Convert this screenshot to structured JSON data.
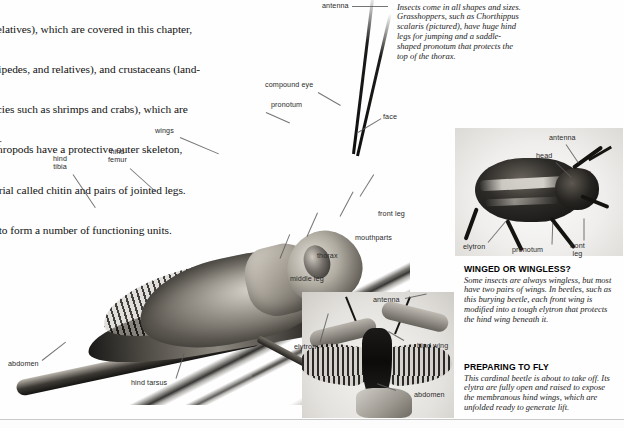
{
  "page": {
    "background_color": "#fefefe",
    "rule_color": "#c9c9c9"
  },
  "body_text": {
    "lines": [
      "and relatives), which are covered in this chapter,",
      ", centipedes, and relatives), and crustaceans (land-",
      "e species such as shrimps and crabs), which are",
      "r. Arthropods have a protective outer skeleton,",
      " material called chitin and pairs of jointed legs.",
      "nged to form a number of functioning units."
    ]
  },
  "side_text": {
    "lines": [
      "ts",
      "and",
      "word",
      "itin for",
      "parate"
    ]
  },
  "captions": [
    {
      "id": "diversity",
      "heading": "DIVERSITY OF FORM",
      "text": "Insects come in all shapes and sizes. Grasshoppers, such as Chorthippus scalaris (pictured), have huge hind legs for jumping and a saddle-shaped pronotum that protects the top of the thorax."
    },
    {
      "id": "winged",
      "heading": "WINGED OR WINGLESS?",
      "text": "Some insects are always wingless, but most have two pairs of wings. In beetles, such as this burying beetle, each front wing is modified into a tough elytron that protects the hind wing beneath it."
    },
    {
      "id": "flying",
      "heading": "PREPARING TO FLY",
      "text": "This cardinal beetle is about to take off. Its elytra are fully open and raised to expose the membranous hind wings, which are unfolded ready to generate lift."
    }
  ],
  "figures": {
    "grasshopper": {
      "name": "grasshopper-photo",
      "labels": [
        {
          "key": "antenna",
          "text": "antenna"
        },
        {
          "key": "compound_eye",
          "text": "compound eye"
        },
        {
          "key": "pronotum",
          "text": "pronotum"
        },
        {
          "key": "face",
          "text": "face"
        },
        {
          "key": "wings",
          "text": "wings"
        },
        {
          "key": "hind_femur",
          "text": "hind\nfemur"
        },
        {
          "key": "hind_tibia",
          "text": "hind\ntibia"
        },
        {
          "key": "front_leg",
          "text": "front leg"
        },
        {
          "key": "mouthparts",
          "text": "mouthparts"
        },
        {
          "key": "thorax",
          "text": "thorax"
        },
        {
          "key": "middle_leg",
          "text": "middle leg"
        },
        {
          "key": "abdomen",
          "text": "abdomen"
        },
        {
          "key": "hind_tarsus",
          "text": "hind tarsus"
        }
      ]
    },
    "burying_beetle": {
      "name": "burying-beetle-photo",
      "labels": [
        {
          "key": "antenna",
          "text": "antenna"
        },
        {
          "key": "head",
          "text": "head"
        },
        {
          "key": "elytron",
          "text": "elytron"
        },
        {
          "key": "pronotum",
          "text": "pronotum"
        },
        {
          "key": "front_leg",
          "text": "front\nleg"
        }
      ]
    },
    "cardinal_beetle": {
      "name": "cardinal-beetle-photo",
      "labels": [
        {
          "key": "antenna",
          "text": "antenna"
        },
        {
          "key": "elytron",
          "text": "elytron"
        },
        {
          "key": "hind_wing",
          "text": "hind wing"
        },
        {
          "key": "abdomen",
          "text": "abdomen"
        }
      ]
    }
  }
}
